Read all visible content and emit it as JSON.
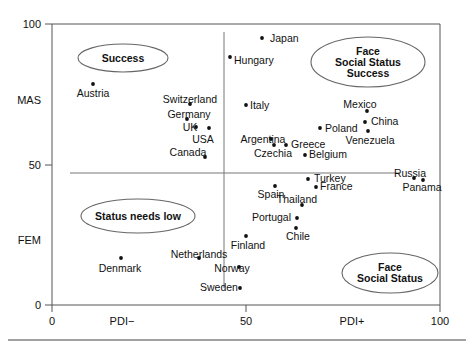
{
  "figure": {
    "title": "",
    "background": "#ffffff",
    "point_color": "#111111",
    "axis_color": "#555555",
    "annotation_outline_color": "#666666"
  },
  "axes": {
    "x": {
      "label_low": "PDI−",
      "label_high": "PDI+",
      "ticks": [
        {
          "value": 0,
          "text": "0"
        },
        {
          "value": 50,
          "text": "50"
        },
        {
          "value": 100,
          "text": "100"
        }
      ],
      "range": [
        0,
        100
      ]
    },
    "y": {
      "label_high": "MAS",
      "label_low": "FEM",
      "ticks": [
        {
          "value": 0,
          "text": "0"
        },
        {
          "value": 50,
          "text": "50"
        },
        {
          "value": 100,
          "text": "100"
        }
      ],
      "range": [
        0,
        100
      ]
    }
  },
  "annotations": [
    {
      "id": "success",
      "lines": [
        "Success"
      ],
      "cx": 123,
      "cy": 58,
      "rx": 45,
      "ry": 14
    },
    {
      "id": "face-social-status-success",
      "lines": [
        "Face",
        "Social Status",
        "Success"
      ],
      "cx": 368,
      "cy": 62,
      "rx": 57,
      "ry": 25
    },
    {
      "id": "status-needs-low",
      "lines": [
        "Status needs low"
      ],
      "cx": 138,
      "cy": 216,
      "rx": 57,
      "ry": 17
    },
    {
      "id": "face-social-status",
      "lines": [
        "Face",
        "Social Status"
      ],
      "cx": 390,
      "cy": 273,
      "rx": 48,
      "ry": 20
    }
  ],
  "chart_data": {
    "type": "scatter",
    "title": "",
    "xlabel": "PDI (Power Distance Index)",
    "ylabel": "MAS / FEM (Masculinity – Femininity)",
    "xlim": [
      0,
      100
    ],
    "ylim": [
      0,
      100
    ],
    "grid": false,
    "legend": "none",
    "quadrant_divider_x": 44,
    "quadrant_divider_y": 47,
    "xtick_labels": [
      "0",
      "50",
      "100"
    ],
    "ytick_labels": [
      "0",
      "50",
      "100"
    ],
    "x_axis_low_label": "PDI−",
    "x_axis_high_label": "PDI+",
    "y_axis_high_label": "MAS",
    "y_axis_low_label": "FEM",
    "annotation_texts": [
      "Success",
      "Face Social Status Success",
      "Status needs low",
      "Face Social Status"
    ],
    "points": [
      {
        "name": "Austria",
        "x": 11,
        "y": 79,
        "px": 93,
        "py": 84,
        "lx": 93,
        "ly": 97,
        "anchor": "middle"
      },
      {
        "name": "Switzerland",
        "x": 35,
        "y": 72,
        "px": 190,
        "py": 104,
        "lx": 190,
        "ly": 103,
        "anchor": "middle"
      },
      {
        "name": "Germany",
        "x": 35,
        "y": 66,
        "px": 187,
        "py": 119,
        "lx": 189,
        "ly": 118,
        "anchor": "middle"
      },
      {
        "name": "UK",
        "x": 35,
        "y": 66,
        "px": 196,
        "py": 127,
        "lx": 190,
        "ly": 131,
        "anchor": "middle"
      },
      {
        "name": "USA",
        "x": 40,
        "y": 62,
        "px": 209,
        "py": 128,
        "lx": 203,
        "ly": 143,
        "anchor": "middle"
      },
      {
        "name": "Canada",
        "x": 39,
        "y": 52,
        "px": 205,
        "py": 157,
        "lx": 188,
        "ly": 156,
        "anchor": "middle"
      },
      {
        "name": "Japan",
        "x": 54,
        "y": 95,
        "px": 262,
        "py": 38,
        "lx": 270,
        "ly": 42,
        "anchor": "start"
      },
      {
        "name": "Hungary",
        "x": 46,
        "y": 88,
        "px": 230,
        "py": 57,
        "lx": 234,
        "ly": 64,
        "anchor": "start"
      },
      {
        "name": "Italy",
        "x": 50,
        "y": 70,
        "px": 246,
        "py": 105,
        "lx": 250,
        "ly": 109,
        "anchor": "start"
      },
      {
        "name": "Argentina",
        "x": 57,
        "y": 56,
        "px": 274,
        "py": 145,
        "lx": 263,
        "ly": 143,
        "anchor": "middle"
      },
      {
        "name": "Czechia",
        "x": 56,
        "y": 57,
        "px": 271,
        "py": 139,
        "lx": 273,
        "ly": 157,
        "anchor": "middle"
      },
      {
        "name": "Greece",
        "x": 60,
        "y": 57,
        "px": 286,
        "py": 145,
        "lx": 291,
        "ly": 148,
        "anchor": "start"
      },
      {
        "name": "Poland",
        "x": 68,
        "y": 64,
        "px": 320,
        "py": 128,
        "lx": 325,
        "ly": 132,
        "anchor": "start"
      },
      {
        "name": "Belgium",
        "x": 65,
        "y": 54,
        "px": 305,
        "py": 155,
        "lx": 309,
        "ly": 158,
        "anchor": "start"
      },
      {
        "name": "Mexico",
        "x": 81,
        "y": 69,
        "px": 367,
        "py": 111,
        "lx": 360,
        "ly": 108,
        "anchor": "middle"
      },
      {
        "name": "China",
        "x": 80,
        "y": 66,
        "px": 365,
        "py": 122,
        "lx": 371,
        "ly": 125,
        "anchor": "start"
      },
      {
        "name": "Venezuela",
        "x": 81,
        "y": 62,
        "px": 368,
        "py": 131,
        "lx": 370,
        "ly": 144,
        "anchor": "middle"
      },
      {
        "name": "Turkey",
        "x": 66,
        "y": 45,
        "px": 308,
        "py": 179,
        "lx": 314,
        "ly": 182,
        "anchor": "start"
      },
      {
        "name": "France",
        "x": 68,
        "y": 43,
        "px": 316,
        "py": 187,
        "lx": 320,
        "ly": 190,
        "anchor": "start"
      },
      {
        "name": "Spain",
        "x": 57,
        "y": 42,
        "px": 275,
        "py": 186,
        "lx": 271,
        "ly": 198,
        "anchor": "middle"
      },
      {
        "name": "Thailand",
        "x": 64,
        "y": 34,
        "px": 302,
        "py": 205,
        "lx": 297,
        "ly": 203,
        "anchor": "middle"
      },
      {
        "name": "Portugal",
        "x": 63,
        "y": 31,
        "px": 297,
        "py": 218,
        "lx": 291,
        "ly": 221,
        "anchor": "end"
      },
      {
        "name": "Chile",
        "x": 63,
        "y": 28,
        "px": 296,
        "py": 228,
        "lx": 298,
        "ly": 240,
        "anchor": "middle"
      },
      {
        "name": "Russia",
        "x": 93,
        "y": 45,
        "px": 414,
        "py": 178,
        "lx": 410,
        "ly": 177,
        "anchor": "middle"
      },
      {
        "name": "Panama",
        "x": 95,
        "y": 44,
        "px": 423,
        "py": 180,
        "lx": 422,
        "ly": 191,
        "anchor": "middle"
      },
      {
        "name": "Finland",
        "x": 50,
        "y": 26,
        "px": 246,
        "py": 236,
        "lx": 248,
        "ly": 249,
        "anchor": "middle"
      },
      {
        "name": "Netherlands",
        "x": 38,
        "y": 14,
        "px": 199,
        "py": 258,
        "lx": 199,
        "ly": 258,
        "anchor": "middle"
      },
      {
        "name": "Denmark",
        "x": 18,
        "y": 16,
        "px": 121,
        "py": 258,
        "lx": 120,
        "ly": 272,
        "anchor": "middle"
      },
      {
        "name": "Norway",
        "x": 31,
        "y": 8,
        "px": 239,
        "py": 267,
        "lx": 232,
        "ly": 272,
        "anchor": "middle"
      },
      {
        "name": "Sweden",
        "x": 31,
        "y": 5,
        "px": 240,
        "py": 288,
        "lx": 219,
        "ly": 291,
        "anchor": "middle"
      }
    ]
  }
}
